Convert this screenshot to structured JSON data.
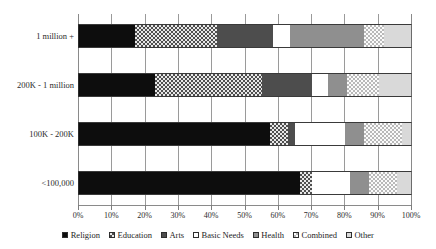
{
  "chart_data": {
    "type": "bar",
    "orientation": "horizontal",
    "stacked": true,
    "stack_mode": "percent",
    "title": "",
    "subtitle": "",
    "xlabel": "",
    "ylabel": "",
    "xlim": [
      0,
      100
    ],
    "xtick_labels": [
      "0%",
      "10%",
      "20%",
      "30%",
      "40%",
      "50%",
      "60%",
      "70%",
      "80%",
      "90%",
      "100%"
    ],
    "xtick_values": [
      0,
      10,
      20,
      30,
      40,
      50,
      60,
      70,
      80,
      90,
      100
    ],
    "grid": "vertical",
    "legend_position": "bottom",
    "categories": [
      "1 million +",
      "200K - 1 million",
      "100K - 200K",
      "<100,000"
    ],
    "series": [
      {
        "name": "Religion",
        "key": "religion",
        "values": [
          17.0,
          23.0,
          57.5,
          66.5
        ]
      },
      {
        "name": "Education",
        "key": "education",
        "values": [
          24.5,
          32.0,
          5.5,
          3.5
        ]
      },
      {
        "name": "Arts",
        "key": "arts",
        "values": [
          17.0,
          15.0,
          2.0,
          0.0
        ]
      },
      {
        "name": "Basic Needs",
        "key": "basicneeds",
        "values": [
          5.0,
          5.0,
          15.0,
          11.5
        ]
      },
      {
        "name": "Health",
        "key": "health",
        "values": [
          22.0,
          5.5,
          5.5,
          5.5
        ]
      },
      {
        "name": "Combined",
        "key": "combined",
        "values": [
          6.0,
          9.5,
          11.5,
          8.5
        ]
      },
      {
        "name": "Other",
        "key": "other",
        "values": [
          8.5,
          10.0,
          3.0,
          4.5
        ]
      }
    ]
  },
  "legend": {
    "items": [
      {
        "label": "Religion",
        "key": "religion"
      },
      {
        "label": "Education",
        "key": "education"
      },
      {
        "label": "Arts",
        "key": "arts"
      },
      {
        "label": "Basic Needs",
        "key": "basicneeds"
      },
      {
        "label": "Health",
        "key": "health"
      },
      {
        "label": "Combined",
        "key": "combined"
      },
      {
        "label": "Other",
        "key": "other"
      }
    ]
  },
  "colors": {
    "religion": "#0d0d0d",
    "education": "#4f4f4f",
    "arts": "#4d4d4d",
    "basicneeds": "#ffffff",
    "health": "#8f8f8f",
    "combined": "#b9b9b9",
    "other": "#d9d9d9",
    "gridline": "#9a9a9a",
    "axis": "#8a8a8a",
    "text": "#2b2b2b",
    "background": "#ffffff"
  }
}
